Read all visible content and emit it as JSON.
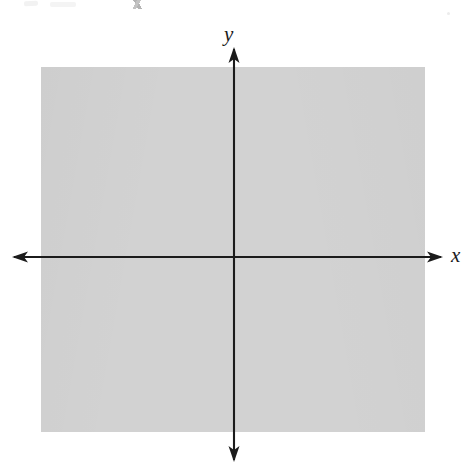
{
  "figure": {
    "kind": "blank-cartesian-coordinate-grid",
    "width": 467,
    "height": 469,
    "background_color": "#ffffff"
  },
  "grid": {
    "panel_color": "#fcfcfc",
    "line_color": "#d2d2d2",
    "cell_size_px": 19.2,
    "left_px": 41,
    "top_px": 67,
    "width_px": 384,
    "height_px": 365,
    "columns": 20,
    "rows": 19,
    "style": "dotted"
  },
  "axes": {
    "color": "#1b1b1b",
    "stroke_width_px": 2,
    "origin": {
      "x": 234,
      "y": 257
    },
    "x_axis": {
      "label": "x",
      "from_px": 12,
      "to_px": 443,
      "y_px": 257,
      "arrow_start": true,
      "arrow_end": true
    },
    "y_axis": {
      "label": "y",
      "from_px": 47,
      "to_px": 462,
      "x_px": 234,
      "arrow_start": true,
      "arrow_end": true
    }
  },
  "labels": {
    "x_axis_label": "x",
    "y_axis_label": "y"
  },
  "chart_data": {
    "type": "scatter",
    "title": "",
    "subtitle": "",
    "xlabel": "x",
    "ylabel": "y",
    "series": [
      {
        "name": "",
        "x": [],
        "y": []
      }
    ],
    "annotations": [],
    "legend": null,
    "legend_position": "none",
    "grid": true,
    "grid_style": "dotted",
    "xlim": [
      -10,
      10
    ],
    "ylim": [
      -9,
      10
    ],
    "xticks": [],
    "yticks": [],
    "xtick_labels": [],
    "ytick_labels": [],
    "note": "Empty graph-paper coordinate plane: axes drawn with arrowheads on both ends, no plotted data, no numeric tick labels."
  }
}
